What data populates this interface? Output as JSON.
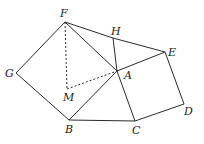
{
  "diagram": {
    "type": "geometry",
    "points": {
      "F": {
        "label": "F",
        "x": 65,
        "y": 22,
        "lx": 60,
        "ly": 17
      },
      "G": {
        "label": "G",
        "x": 16,
        "y": 73,
        "lx": 5,
        "ly": 77
      },
      "H": {
        "label": "H",
        "x": 113,
        "y": 38,
        "lx": 111,
        "ly": 35
      },
      "E": {
        "label": "E",
        "x": 165,
        "y": 52,
        "lx": 168,
        "ly": 56
      },
      "A": {
        "label": "A",
        "x": 117,
        "y": 71,
        "lx": 124,
        "ly": 79
      },
      "M": {
        "label": "M",
        "x": 67,
        "y": 89,
        "lx": 63,
        "ly": 101
      },
      "B": {
        "label": "B",
        "x": 69,
        "y": 120,
        "lx": 65,
        "ly": 133
      },
      "C": {
        "label": "C",
        "x": 135,
        "y": 121,
        "lx": 132,
        "ly": 134
      },
      "D": {
        "label": "D",
        "x": 184,
        "y": 104,
        "lx": 184,
        "ly": 115
      }
    },
    "solid_segments": [
      [
        "F",
        "G"
      ],
      [
        "G",
        "B"
      ],
      [
        "B",
        "A"
      ],
      [
        "A",
        "F"
      ],
      [
        "F",
        "H"
      ],
      [
        "H",
        "E"
      ],
      [
        "H",
        "A"
      ],
      [
        "A",
        "E"
      ],
      [
        "A",
        "C"
      ],
      [
        "E",
        "D"
      ],
      [
        "D",
        "C"
      ],
      [
        "C",
        "B"
      ]
    ],
    "dashed_segments": [
      [
        "F",
        "M"
      ],
      [
        "M",
        "A"
      ]
    ]
  }
}
